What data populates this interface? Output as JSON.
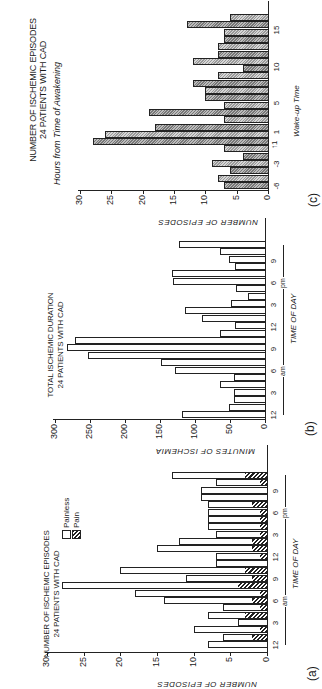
{
  "figure": {
    "panel_letters": [
      "(a)",
      "(b)",
      "(c)"
    ]
  },
  "chart_data": [
    {
      "type": "bar",
      "stacked": true,
      "panel": "(a)",
      "title": "NUMBER OF ISCHEMIC EPISODES 24 PATIENTS WITH CAD",
      "title_line1": "NUMBER OF ISCHEMIC EPISODES",
      "title_line2": "24 PATIENTS WITH CAD",
      "xlabel": "TIME OF DAY",
      "ylabel": "NUMBER OF EPISODES",
      "ylim": [
        0,
        30
      ],
      "yticks": [
        0,
        5,
        10,
        15,
        20,
        25,
        30
      ],
      "xtick_labels": [
        "12",
        "3",
        "6",
        "9",
        "12",
        "3",
        "6",
        "9"
      ],
      "am_label": "am",
      "pm_label": "pm",
      "legend": [
        "Painless",
        "Pain"
      ],
      "categories": [
        0,
        1,
        2,
        3,
        4,
        5,
        6,
        7,
        8,
        9,
        10,
        11,
        12,
        13,
        14,
        15,
        16,
        17,
        18,
        19,
        20,
        21,
        22,
        23
      ],
      "series": [
        {
          "name": "Painless",
          "values": [
            8,
            4,
            9,
            4,
            5,
            5,
            12,
            17,
            24,
            9,
            17,
            7,
            6,
            13,
            10,
            6,
            7,
            7,
            7,
            6,
            9,
            9,
            6,
            10
          ]
        },
        {
          "name": "Pain",
          "values": [
            0,
            2,
            1,
            0,
            3,
            1,
            2,
            1,
            4,
            2,
            3,
            0,
            1,
            2,
            2,
            1,
            1,
            1,
            1,
            2,
            0,
            0,
            1,
            3
          ]
        }
      ],
      "totals": [
        8,
        6,
        10,
        4,
        8,
        6,
        14,
        18,
        28,
        11,
        20,
        7,
        7,
        15,
        12,
        7,
        8,
        8,
        8,
        8,
        9,
        9,
        7,
        13
      ]
    },
    {
      "type": "bar",
      "panel": "(b)",
      "title": "TOTAL ISCHEMIC DURATION 24 PATIENTS WITH CAD",
      "title_line1": "TOTAL ISCHEMIC DURATION",
      "title_line2": "24 PATIENTS WITH CAD",
      "xlabel": "TIME OF DAY",
      "ylabel": "MINUTES OF ISCHEMIA",
      "ylim": [
        0,
        300
      ],
      "yticks": [
        0,
        50,
        100,
        150,
        200,
        250,
        300
      ],
      "xtick_labels": [
        "12",
        "3",
        "6",
        "9",
        "12",
        "3",
        "6",
        "9"
      ],
      "am_label": "am",
      "pm_label": "pm",
      "categories": [
        0,
        1,
        2,
        3,
        4,
        5,
        6,
        7,
        8,
        9,
        10,
        11,
        12,
        13,
        14,
        15,
        16,
        17,
        18,
        19,
        20,
        21,
        22,
        23
      ],
      "values": [
        118,
        51,
        44,
        44,
        65,
        44,
        128,
        149,
        253,
        283,
        271,
        65,
        43,
        90,
        114,
        49,
        25,
        41,
        131,
        133,
        43,
        52,
        64,
        123
      ]
    },
    {
      "type": "bar",
      "panel": "(c)",
      "title": "NUMBER OF ISCHEMIC EPISODES 24 PATIENTS WITH CAD",
      "title_line1": "NUMBER OF ISCHEMIC EPISODES",
      "title_line2": "24 PATIENTS WITH CAD",
      "subtitle": "Hours from Time of Awakening",
      "xlabel": "Wake-up Time",
      "ylabel": "NUMBER OF EPISODES",
      "ylim": [
        0,
        30
      ],
      "yticks": [
        0,
        5,
        10,
        15,
        20,
        25,
        30
      ],
      "xtick_labels": [
        "-6",
        "-3",
        "1",
        "5",
        "10",
        "15"
      ],
      "wakeup_marker": "↑1",
      "categories": [
        -6,
        -5,
        -4,
        -3,
        -2,
        -1,
        0,
        1,
        2,
        3,
        4,
        5,
        6,
        7,
        8,
        9,
        10,
        11,
        12,
        13,
        14,
        15,
        16,
        17
      ],
      "values": [
        7,
        8,
        6,
        9,
        4,
        7,
        28,
        26,
        18,
        7,
        19,
        7,
        10,
        10,
        12,
        8,
        4,
        12,
        8,
        8,
        7,
        7,
        13,
        6
      ]
    }
  ]
}
